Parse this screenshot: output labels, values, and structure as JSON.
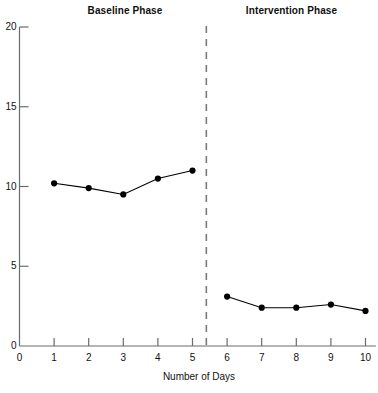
{
  "chart_data": {
    "type": "line",
    "title": "",
    "xlabel": "Number of Days",
    "ylabel": "",
    "xlim": [
      0,
      10.3
    ],
    "ylim": [
      0,
      20
    ],
    "xticks": [
      0,
      1,
      2,
      3,
      4,
      5,
      6,
      7,
      8,
      9,
      10
    ],
    "yticks": [
      0,
      5,
      10,
      15,
      20
    ],
    "grid": false,
    "legend": false,
    "marker": "filled-circle",
    "line_color": "#000000",
    "marker_color": "#000000",
    "axis_color": "#6b6b6b",
    "phase_line": {
      "x": 5.4,
      "style": "dashed",
      "color": "#7a7a7a"
    },
    "annotations": [
      {
        "text": "Baseline Phase",
        "position": "top-left-section"
      },
      {
        "text": "Intervention Phase",
        "position": "top-right-section"
      }
    ],
    "series": [
      {
        "name": "Baseline Phase",
        "x": [
          1,
          2,
          3,
          4,
          5
        ],
        "values": [
          10.2,
          9.9,
          9.5,
          10.5,
          11.0
        ]
      },
      {
        "name": "Intervention Phase",
        "x": [
          6,
          7,
          8,
          9,
          10
        ],
        "values": [
          3.1,
          2.4,
          2.4,
          2.6,
          2.2
        ]
      }
    ]
  },
  "titles": {
    "baseline": "Baseline Phase",
    "intervention": "Intervention Phase"
  },
  "axes": {
    "x_title": "Number of Days",
    "x_tick_labels": [
      "0",
      "1",
      "2",
      "3",
      "4",
      "5",
      "6",
      "7",
      "8",
      "9",
      "10"
    ],
    "y_tick_labels": [
      "0",
      "5",
      "10",
      "15",
      "20"
    ]
  }
}
